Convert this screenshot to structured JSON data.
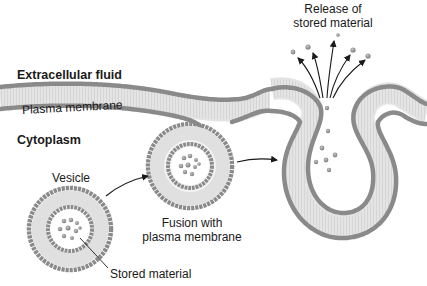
{
  "labels": {
    "extracellular": "Extracellular fluid",
    "plasma_membrane": "Plasma membrane",
    "cytoplasm": "Cytoplasm",
    "vesicle": "Vesicle",
    "stored_material": "Stored material",
    "fusion_line1": "Fusion with",
    "fusion_line2": "plasma membrane",
    "release_line1": "Release of",
    "release_line2": "stored material"
  },
  "colors": {
    "head": "#9a9a9a",
    "head_stroke": "#6e6e6e",
    "tail": "#d8d8d8",
    "particle": "#7c7c7c",
    "arrow": "#1a1a1a",
    "text": "#1a1a1a"
  }
}
